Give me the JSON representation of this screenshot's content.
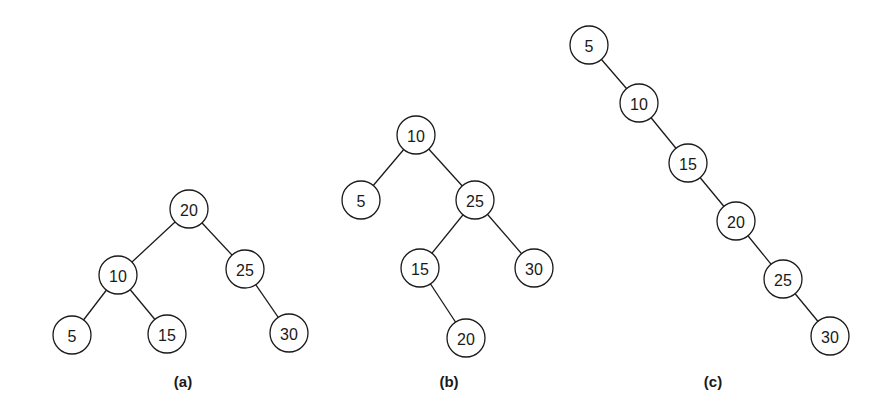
{
  "diagram": {
    "trees": [
      {
        "id": "a",
        "caption": "(a)",
        "root": "20",
        "nodes": [
          "20",
          "10",
          "25",
          "5",
          "15",
          "30"
        ],
        "edges": [
          [
            "20",
            "10"
          ],
          [
            "20",
            "25"
          ],
          [
            "10",
            "5"
          ],
          [
            "10",
            "15"
          ],
          [
            "25",
            "30"
          ]
        ]
      },
      {
        "id": "b",
        "caption": "(b)",
        "root": "10",
        "nodes": [
          "10",
          "5",
          "25",
          "15",
          "30",
          "20"
        ],
        "edges": [
          [
            "10",
            "5"
          ],
          [
            "10",
            "25"
          ],
          [
            "25",
            "15"
          ],
          [
            "25",
            "30"
          ],
          [
            "15",
            "20"
          ]
        ]
      },
      {
        "id": "c",
        "caption": "(c)",
        "root": "5",
        "nodes": [
          "5",
          "10",
          "15",
          "20",
          "25",
          "30"
        ],
        "edges": [
          [
            "5",
            "10"
          ],
          [
            "10",
            "15"
          ],
          [
            "15",
            "20"
          ],
          [
            "20",
            "25"
          ],
          [
            "25",
            "30"
          ]
        ]
      }
    ]
  }
}
